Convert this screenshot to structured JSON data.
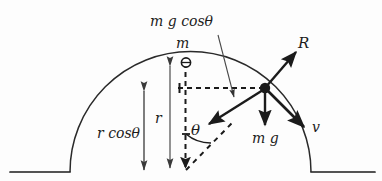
{
  "figure": {
    "type": "physics-free-body-diagram"
  },
  "labels": {
    "mass": "m",
    "radius": "r",
    "height": "r cosθ",
    "angle": "θ",
    "normal_force": "R",
    "weight": "m g",
    "weight_component": "m g cosθ",
    "velocity": "v"
  },
  "geometry": {
    "dome_center_x": 185,
    "dome_center_y": 172,
    "dome_radius": 110,
    "apex_x": 185,
    "apex_y": 62,
    "particle_x": 265,
    "particle_y": 88,
    "ground_y": 172,
    "ground_left_start": 10,
    "ground_left_end": 70,
    "ground_right_start": 310,
    "ground_right_end": 375,
    "theta_degrees": 43
  },
  "colors": {
    "stroke": "#1b1b1b",
    "background": "#fdfdfd",
    "thin_line": "#555555"
  }
}
